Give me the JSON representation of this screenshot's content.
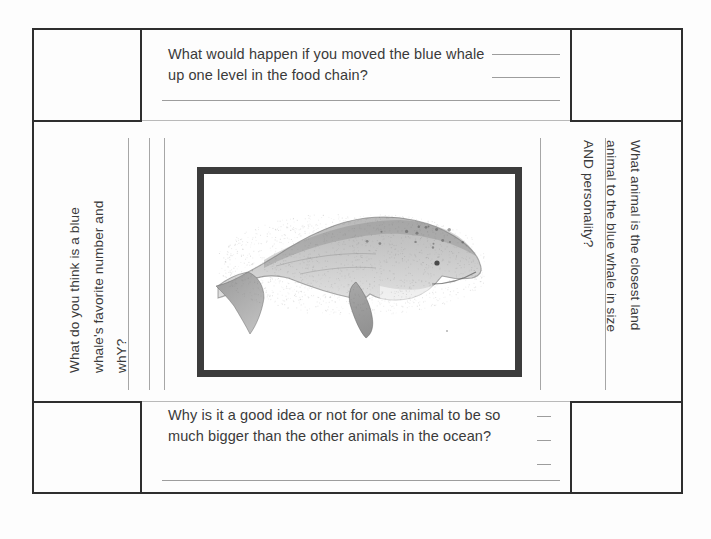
{
  "document": {
    "type": "worksheet-scan",
    "title": "Blue Whale Question Worksheet",
    "page_background": "#fdfdfd",
    "ink_color": "#3a3a3a",
    "frame_color": "#2e2e2e",
    "rule_color": "#9d9d9d"
  },
  "questions": {
    "top": {
      "text": "What would happen if you moved the blue whale\nup one level in the food chain?",
      "answer_lines": 3,
      "position": "top"
    },
    "bottom": {
      "text": "Why is it a good idea or not for one animal to be so\nmuch bigger than the other animals in the ocean?",
      "answer_lines": 4,
      "position": "bottom"
    },
    "left": {
      "text": "What do you think is a blue\nwhale's favorite number and\nwhY?",
      "answer_lines": 3,
      "position": "left",
      "rotation": "-90deg"
    },
    "right": {
      "text": "What animal is the closest land\nanimal to the blue whale in size\nAND personality?",
      "answer_lines": 2,
      "position": "right",
      "rotation": "90deg"
    }
  },
  "illustration": {
    "name": "blue-whale-illustration",
    "alt": "Grayscale pencil illustration of a blue whale facing right",
    "border_color": "#3c3c3c",
    "border_width_px": 7
  },
  "corner_cells": [
    {
      "name": "top-left-cell",
      "content": ""
    },
    {
      "name": "top-right-cell",
      "content": ""
    },
    {
      "name": "bottom-left-cell",
      "content": ""
    },
    {
      "name": "bottom-right-cell",
      "content": ""
    }
  ]
}
